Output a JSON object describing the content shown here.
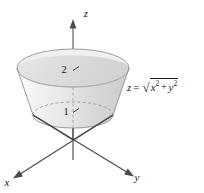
{
  "figure": {
    "background_color": "#ffffff",
    "axes": {
      "z": {
        "label": "z",
        "label_x": 86,
        "label_y": 17
      },
      "x": {
        "label": "x",
        "label_x": 7,
        "label_y": 182
      },
      "y": {
        "label": "y",
        "label_x": 136,
        "label_y": 177
      }
    },
    "ticks": [
      {
        "value": "2",
        "label_x": 64,
        "label_y": 73,
        "axis": "z"
      },
      {
        "value": "1",
        "label_x": 66,
        "label_y": 115,
        "axis": "z"
      }
    ],
    "equation": {
      "lhs": "z",
      "relation": "=",
      "radical_sign": "√",
      "term1_base": "x",
      "term1_exp": "2",
      "operator": "+",
      "term2_base": "y",
      "term2_exp": "2",
      "plain": "z = √(x² + y²)"
    },
    "surface": {
      "type": "frustum-of-cone",
      "top_level": 2,
      "bottom_level": 1,
      "fill_light": "#f4f4f4",
      "fill_mid": "#e3e3e3",
      "fill_dark": "#cfcfcf",
      "edge_color": "#8f8f8f"
    },
    "colors": {
      "axis": "#4a4a4a",
      "text": "#1a1a1a",
      "dashed": "#9a9a9a"
    }
  }
}
